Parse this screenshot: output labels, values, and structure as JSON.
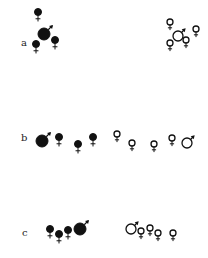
{
  "panels": [
    {
      "label": "a",
      "label_pos": [
        21,
        38
      ],
      "groups": [
        {
          "fill": "filled",
          "symbols": [
            {
              "sex": "female",
              "x": 38,
              "y": 12,
              "r": 3.5
            },
            {
              "sex": "male",
              "x": 44,
              "y": 34,
              "r": 6
            },
            {
              "sex": "female",
              "x": 36,
              "y": 44,
              "r": 3.5
            },
            {
              "sex": "female",
              "x": 55,
              "y": 40,
              "r": 3.5
            }
          ]
        },
        {
          "fill": "open",
          "symbols": [
            {
              "sex": "female",
              "x": 170,
              "y": 22,
              "r": 3
            },
            {
              "sex": "male",
              "x": 178,
              "y": 36,
              "r": 5
            },
            {
              "sex": "female",
              "x": 170,
              "y": 43,
              "r": 3
            },
            {
              "sex": "female",
              "x": 186,
              "y": 40,
              "r": 3
            },
            {
              "sex": "female",
              "x": 196,
              "y": 29,
              "r": 3
            }
          ]
        }
      ]
    },
    {
      "label": "b",
      "label_pos": [
        21,
        133
      ],
      "groups": [
        {
          "fill": "filled",
          "symbols": [
            {
              "sex": "male",
              "x": 42,
              "y": 141,
              "r": 6
            },
            {
              "sex": "female",
              "x": 59,
              "y": 137,
              "r": 3.5
            },
            {
              "sex": "female",
              "x": 78,
              "y": 144,
              "r": 3.5
            },
            {
              "sex": "female",
              "x": 93,
              "y": 137,
              "r": 3.5
            }
          ]
        },
        {
          "fill": "open",
          "symbols": [
            {
              "sex": "female",
              "x": 117,
              "y": 134,
              "r": 3
            },
            {
              "sex": "female",
              "x": 132,
              "y": 143,
              "r": 3
            },
            {
              "sex": "female",
              "x": 154,
              "y": 144,
              "r": 3
            },
            {
              "sex": "female",
              "x": 172,
              "y": 138,
              "r": 3
            },
            {
              "sex": "male",
              "x": 187,
              "y": 143,
              "r": 5
            }
          ]
        }
      ]
    },
    {
      "label": "c",
      "label_pos": [
        22,
        228
      ],
      "groups": [
        {
          "fill": "filled",
          "symbols": [
            {
              "sex": "female",
              "x": 50,
              "y": 229,
              "r": 3.5
            },
            {
              "sex": "female",
              "x": 59,
              "y": 234,
              "r": 3.5
            },
            {
              "sex": "female",
              "x": 68,
              "y": 230,
              "r": 3.5
            },
            {
              "sex": "male",
              "x": 80,
              "y": 229,
              "r": 6
            }
          ]
        },
        {
          "fill": "open",
          "symbols": [
            {
              "sex": "male",
              "x": 131,
              "y": 229,
              "r": 5
            },
            {
              "sex": "female",
              "x": 141,
              "y": 231,
              "r": 3
            },
            {
              "sex": "female",
              "x": 150,
              "y": 228,
              "r": 3
            },
            {
              "sex": "female",
              "x": 158,
              "y": 233,
              "r": 3
            },
            {
              "sex": "female",
              "x": 173,
              "y": 233,
              "r": 3
            }
          ]
        }
      ]
    }
  ],
  "colors": {
    "ink": "#111111",
    "background": "#ffffff"
  }
}
